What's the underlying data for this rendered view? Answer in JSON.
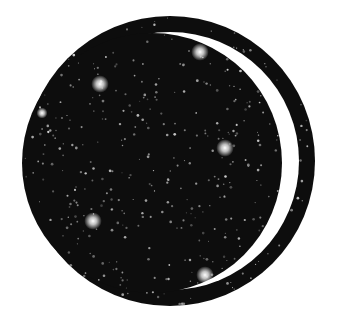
{
  "image": {
    "description": "Circular starfield emblem with white crescent and outer ring",
    "background": "#ffffff",
    "fill": "#0d0d0d",
    "outer_ring": {
      "cx": 170,
      "cy": 161,
      "r": 145,
      "width": 16
    },
    "inner_disc": {
      "cx": 152,
      "cy": 163,
      "r": 130
    },
    "bright_stars": [
      {
        "x": 200,
        "y": 52,
        "r": 4
      },
      {
        "x": 100,
        "y": 84,
        "r": 4
      },
      {
        "x": 42,
        "y": 113,
        "r": 2.5
      },
      {
        "x": 225,
        "y": 148,
        "r": 4
      },
      {
        "x": 93,
        "y": 221,
        "r": 4
      },
      {
        "x": 205,
        "y": 275,
        "r": 4
      }
    ],
    "star_density": 700
  }
}
